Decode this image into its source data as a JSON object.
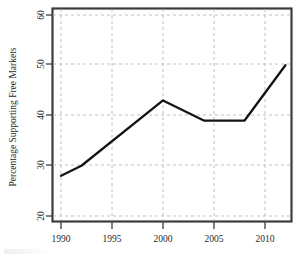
{
  "chart_data": {
    "type": "line",
    "title": "",
    "xlabel": "",
    "ylabel": "Percentage Supporting Free Markets",
    "x": [
      1990,
      1992,
      2000,
      2004,
      2008,
      2012
    ],
    "values": [
      28,
      30,
      43,
      39,
      39,
      50
    ],
    "series": [
      {
        "name": "Percentage Supporting Free Markets",
        "x": [
          1990,
          1992,
          2000,
          2004,
          2008,
          2012
        ],
        "values": [
          28,
          30,
          43,
          39,
          39,
          50
        ]
      }
    ],
    "xlim": [
      1989,
      1991.6
    ],
    "ylim": [
      19.2,
      61.5
    ],
    "xticks": [
      1990,
      1995,
      2000,
      2005,
      2010
    ],
    "xtick_labels": [
      "1990",
      "1995",
      "2000",
      "2005",
      "2010"
    ],
    "yticks": [
      20,
      30,
      40,
      50,
      60
    ],
    "ytick_labels": [
      "20",
      "30",
      "40",
      "50",
      "60"
    ],
    "grid": true,
    "grid_style": "dashed",
    "legend": "none",
    "line_color": "#141414",
    "grid_color": "#b9b9b9",
    "frame_color": "#3c3c3c",
    "background_color": "#ffffff"
  },
  "axes": {
    "y_axis_title": "Percentage Supporting Free Markets",
    "x_axis_title": ""
  }
}
